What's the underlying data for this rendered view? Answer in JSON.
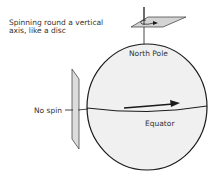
{
  "diagram": {
    "labels": {
      "vertical_axis_line1": "Spinning round a vertical",
      "vertical_axis_line2": "axis, like a disc",
      "north_pole": "North Pole",
      "no_spin": "No spin",
      "equator": "Equator"
    },
    "colors": {
      "sphere_fill": "#f0f0f0",
      "outline": "#1a1a1a",
      "plane_fill": "#d9d9d9",
      "text": "#333333"
    }
  }
}
